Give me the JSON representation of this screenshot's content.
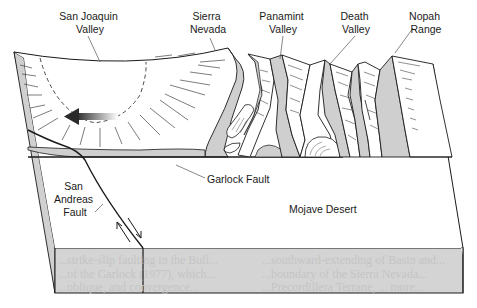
{
  "diagram": {
    "type": "block-diagram",
    "colors": {
      "line": "#1a1a1a",
      "face_fill": "#d4d4d4",
      "scarp_fill": "#cfcfcf",
      "top_fill": "#ffffff",
      "arrow": "#333333"
    },
    "labels": {
      "san_joaquin": [
        "San Joaquin",
        "Valley"
      ],
      "sierra_nevada": [
        "Sierra",
        "Nevada"
      ],
      "panamint": [
        "Panamint",
        "Valley"
      ],
      "death_valley": [
        "Death",
        "Valley"
      ],
      "nopah": [
        "Nopah",
        "Range"
      ],
      "garlock": "Garlock Fault",
      "san_andreas": [
        "San",
        "Andreas",
        "Fault"
      ],
      "mojave": "Mojave Desert"
    },
    "bleed_through_text": {
      "left": [
        "...strike-slip faulting in the Bull...",
        "...of the Garlock (1977), which...",
        "...oblique, and convergence..."
      ],
      "right": [
        "...southward-extending of Basin and...",
        "...boundary of the Sierra Nevada...",
        "...Precordillera Terrane, ... more..."
      ]
    }
  }
}
